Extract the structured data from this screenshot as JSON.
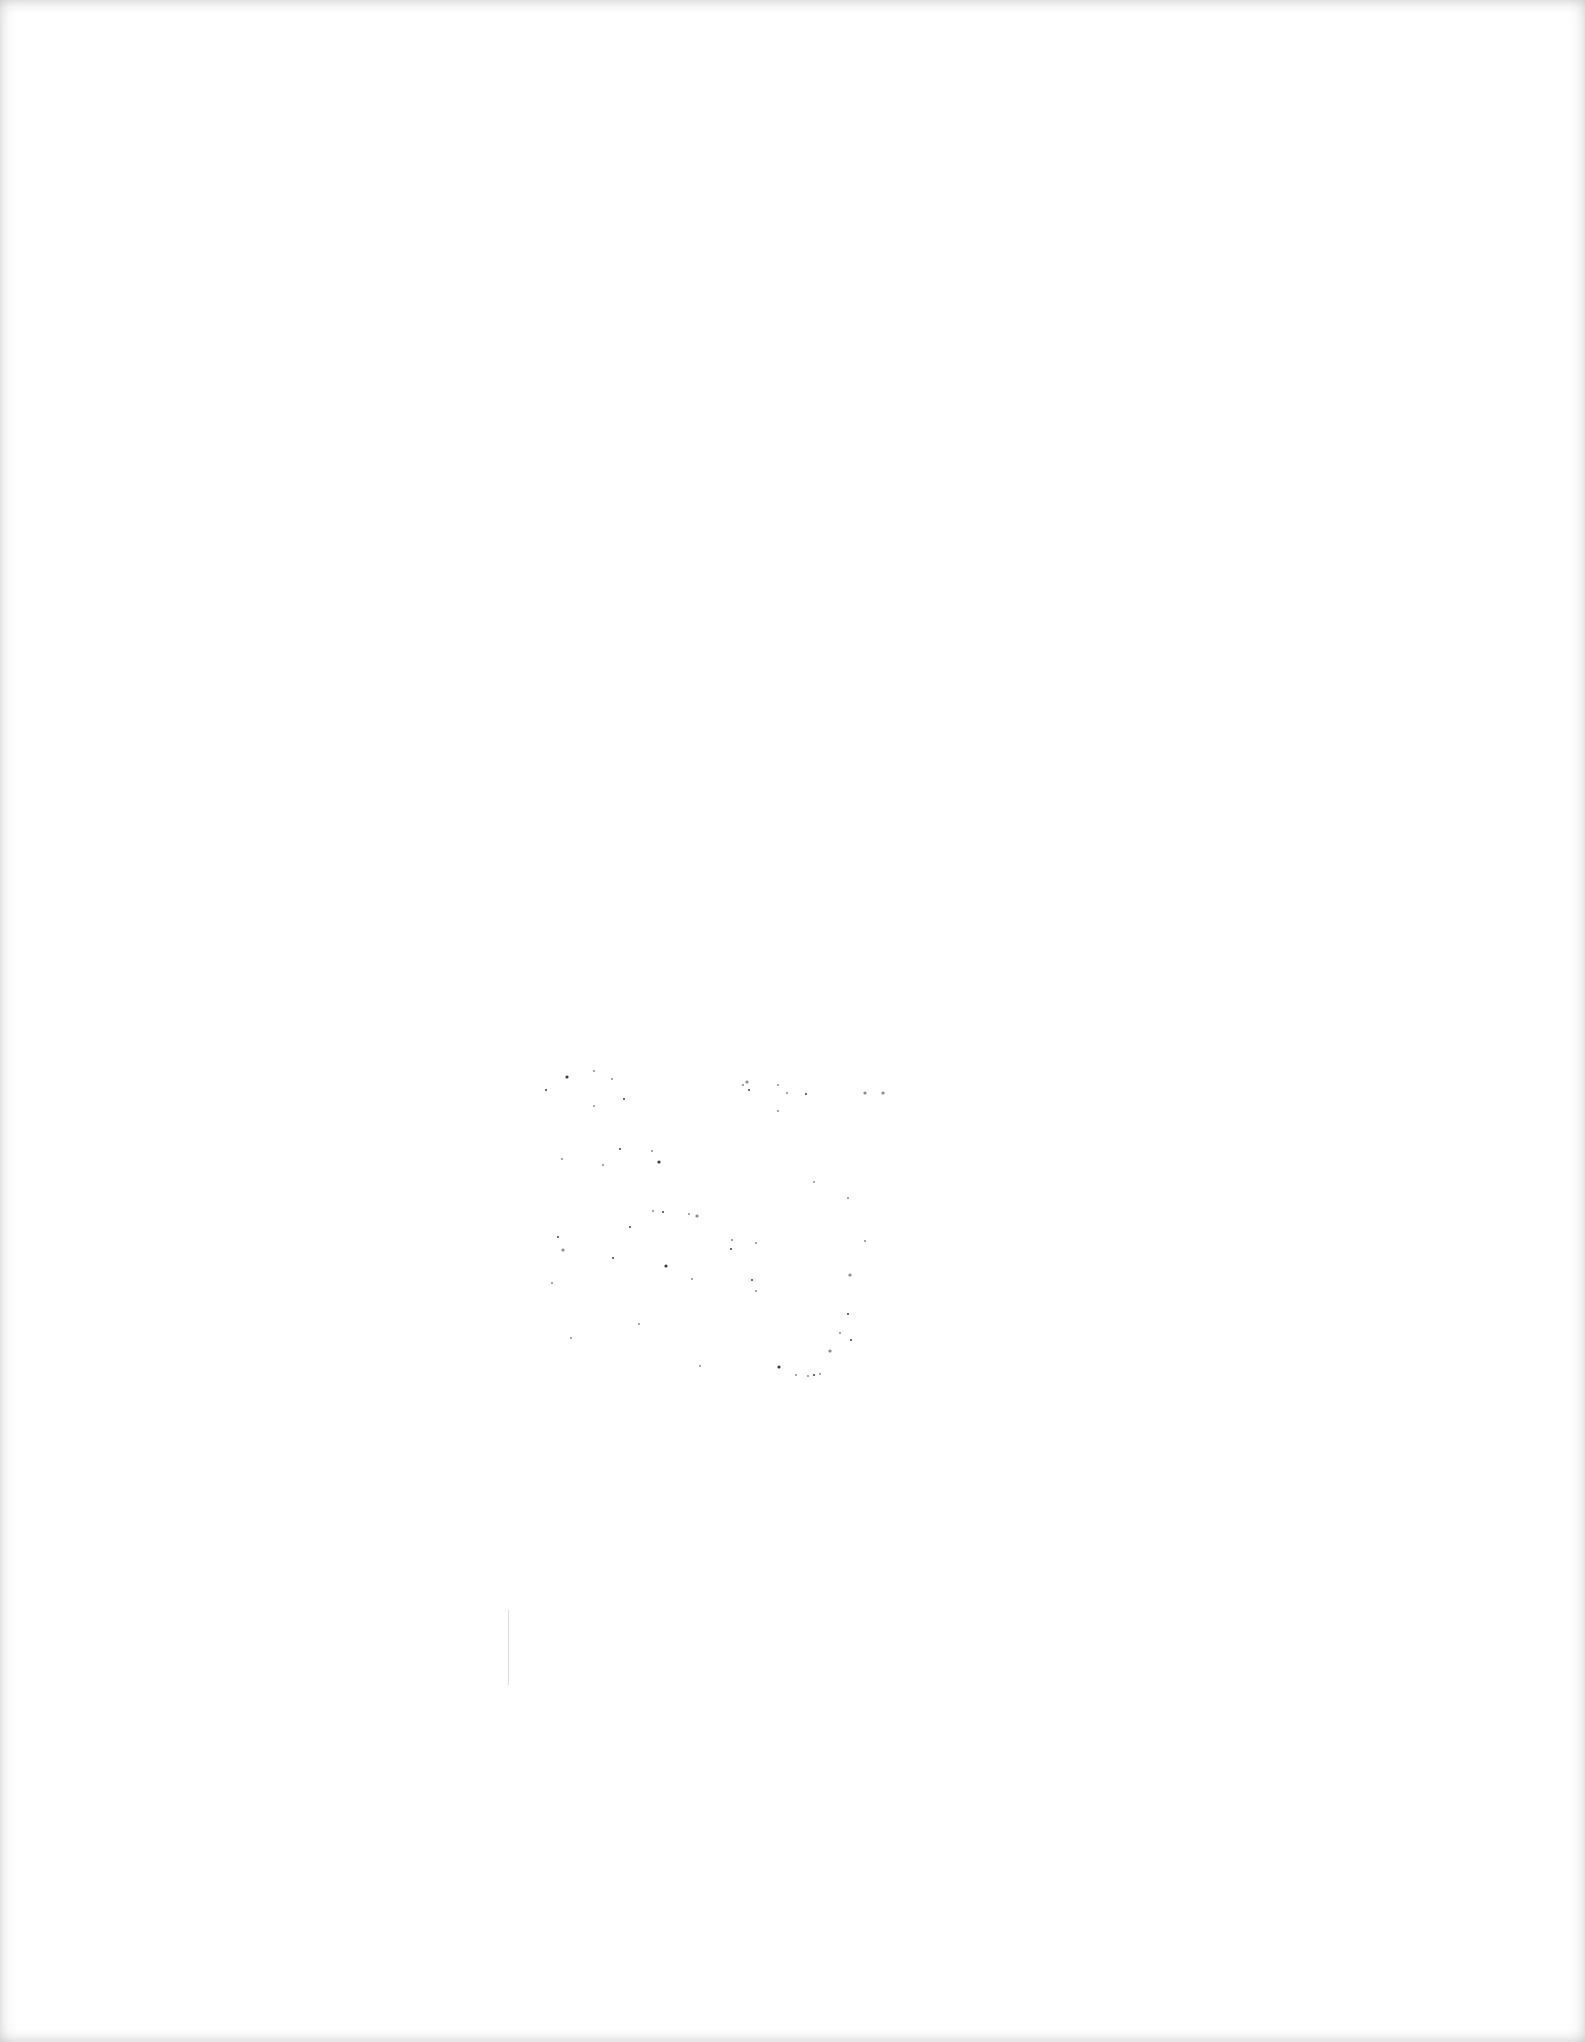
{
  "page": {
    "background_color": "#ffffff",
    "content": "",
    "noise_color": "#1a1a1a"
  },
  "specks": [
    [
      567,
      1077
    ],
    [
      594,
      1071
    ],
    [
      612,
      1079
    ],
    [
      624,
      1099
    ],
    [
      743,
      1085
    ],
    [
      747,
      1082
    ],
    [
      749,
      1090
    ],
    [
      778,
      1085
    ],
    [
      787,
      1093
    ],
    [
      806,
      1094
    ],
    [
      865,
      1093
    ],
    [
      778,
      1111
    ],
    [
      620,
      1149
    ],
    [
      603,
      1165
    ],
    [
      562,
      1159
    ],
    [
      659,
      1162
    ],
    [
      652,
      1151
    ],
    [
      653,
      1211
    ],
    [
      663,
      1212
    ],
    [
      689,
      1214
    ],
    [
      697,
      1216
    ],
    [
      630,
      1227
    ],
    [
      814,
      1182
    ],
    [
      848,
      1198
    ],
    [
      558,
      1237
    ],
    [
      563,
      1250
    ],
    [
      732,
      1240
    ],
    [
      731,
      1249
    ],
    [
      756,
      1243
    ],
    [
      865,
      1241
    ],
    [
      666,
      1266
    ],
    [
      692,
      1279
    ],
    [
      552,
      1283
    ],
    [
      752,
      1280
    ],
    [
      756,
      1291
    ],
    [
      850,
      1275
    ],
    [
      848,
      1314
    ],
    [
      571,
      1338
    ],
    [
      840,
      1333
    ],
    [
      851,
      1340
    ],
    [
      830,
      1351
    ],
    [
      820,
      1374
    ],
    [
      814,
      1375
    ],
    [
      808,
      1376
    ],
    [
      796,
      1375
    ],
    [
      779,
      1367
    ],
    [
      700,
      1366
    ],
    [
      639,
      1324
    ],
    [
      546,
      1090
    ],
    [
      594,
      1106
    ],
    [
      883,
      1093
    ],
    [
      613,
      1258
    ]
  ]
}
